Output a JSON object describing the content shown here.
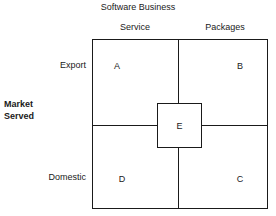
{
  "chart_data": {
    "type": "table",
    "title": "Software Business",
    "xlabel": "Software Business",
    "ylabel": "Market Served",
    "grid": true,
    "legend": null,
    "columns": [
      "Service",
      "Packages"
    ],
    "rows": [
      "Export",
      "Domestic"
    ],
    "cells": [
      {
        "row": "Export",
        "column": "Service",
        "label": "A"
      },
      {
        "row": "Export",
        "column": "Packages",
        "label": "B"
      },
      {
        "row": "Domestic",
        "column": "Service",
        "label": "D"
      },
      {
        "row": "Domestic",
        "column": "Packages",
        "label": "C"
      }
    ],
    "center_cell": {
      "label": "E",
      "position": "center"
    },
    "values": [
      "A",
      "B",
      "E",
      "D",
      "C"
    ],
    "categories": [
      "A",
      "B",
      "C",
      "D",
      "E"
    ]
  },
  "figure": {
    "title": "Software Business",
    "column_axis_label": "Software Business",
    "row_axis_label_line1": "Market",
    "row_axis_label_line2": "Served",
    "columns": {
      "service": "Service",
      "packages": "Packages"
    },
    "rows": {
      "export": "Export",
      "domestic": "Domestic"
    },
    "quadrants": {
      "top_left": "A",
      "top_right": "B",
      "bottom_left": "D",
      "bottom_right": "C",
      "center": "E"
    },
    "colors": {
      "line": "#1a1a1a",
      "text": "#1a1a1a",
      "background": "#ffffff"
    }
  }
}
